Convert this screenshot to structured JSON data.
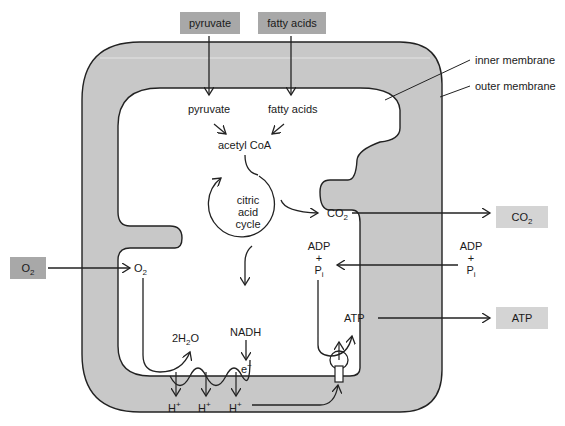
{
  "diagram": {
    "colors": {
      "membrane_fill": "#c8c8c8",
      "outline": "#222222",
      "input_box": "#a8a8a8",
      "output_box": "#d4d4d4"
    },
    "inputs": {
      "pyruvate": "pyruvate",
      "fatty_acids": "fatty acids",
      "o2_main": "O",
      "o2_sub": "2"
    },
    "outputs": {
      "co2_main": "CO",
      "co2_sub": "2",
      "atp": "ATP"
    },
    "labels": {
      "inner_membrane": "inner membrane",
      "outer_membrane": "outer membrane",
      "pyruvate_inner": "pyruvate",
      "fatty_acids_inner": "fatty acids",
      "acetyl_coa": "acetyl CoA",
      "cycle_line1": "citric",
      "cycle_line2": "acid",
      "cycle_line3": "cycle",
      "co2_inner_main": "CO",
      "co2_inner_sub": "2",
      "adp_inner": "ADP",
      "plus_inner": "+",
      "pi_inner_main": "P",
      "pi_inner_sub": "i",
      "adp_outer": "ADP",
      "plus_outer": "+",
      "pi_outer_main": "P",
      "pi_outer_sub": "i",
      "o2_inner_main": "O",
      "o2_inner_sub": "2",
      "nadh": "NADH",
      "electron_main": "e",
      "electron_sup": "−",
      "water_prefix": "2H",
      "water_sub": "2",
      "water_suffix": "O",
      "atp_inner": "ATP",
      "proton_main": "H",
      "proton_sup": "+"
    }
  }
}
